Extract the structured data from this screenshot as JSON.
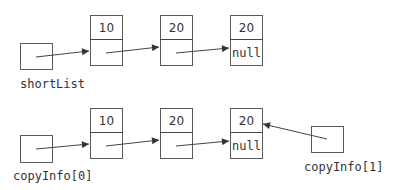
{
  "diagram": {
    "type": "linked-list-references",
    "rows": [
      {
        "pointer_label": "shortList",
        "nodes": [
          {
            "value": "10",
            "next": ""
          },
          {
            "value": "20",
            "next": ""
          },
          {
            "value": "20",
            "next": "null"
          }
        ]
      },
      {
        "pointer_label": "copyInfo[0]",
        "nodes": [
          {
            "value": "10",
            "next": ""
          },
          {
            "value": "20",
            "next": ""
          },
          {
            "value": "20",
            "next": "null"
          }
        ],
        "extra_pointer": {
          "label": "copyInfo[1]",
          "points_to_node": 2
        }
      }
    ],
    "colors": {
      "stroke": "#5a5a5a",
      "text": "#333333",
      "background": "#ffffff"
    }
  }
}
